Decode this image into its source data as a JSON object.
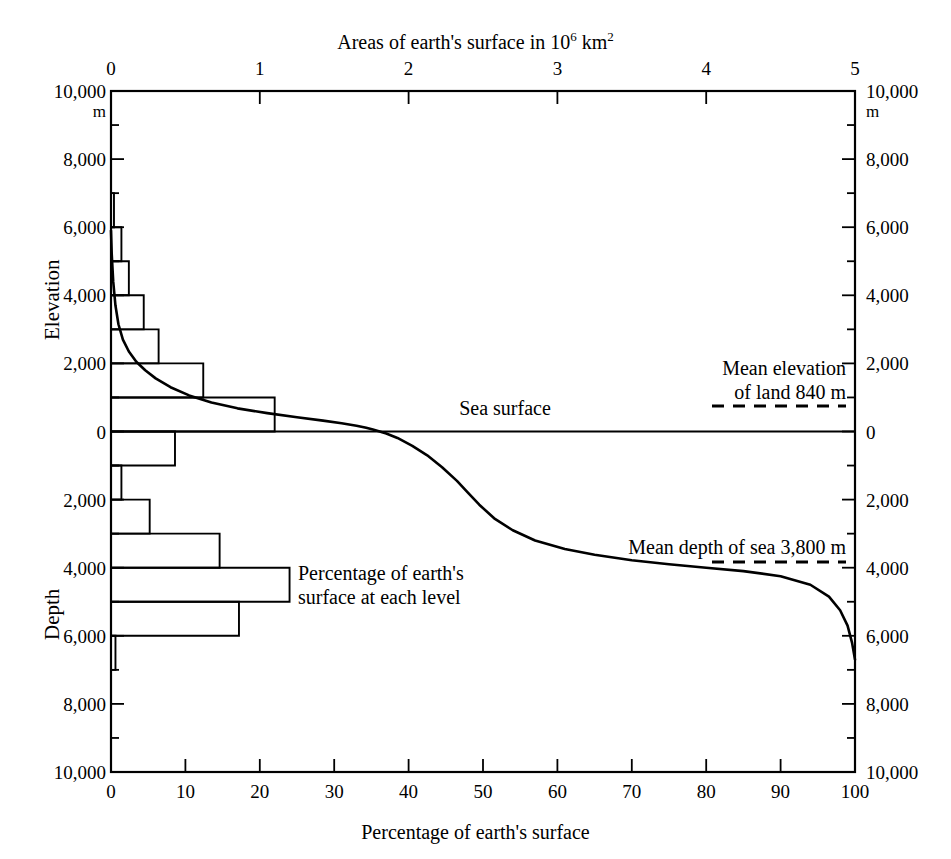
{
  "chart_data": {
    "type": "line",
    "title_base": "Areas of earth's surface in 10",
    "title_sup": "6",
    "title_tail": " km",
    "title_tail_sup": "2",
    "xlabel": "Percentage of earth's surface",
    "ylabel_upper": "Elevation",
    "ylabel_lower": "Depth",
    "unit_label": "m",
    "xlim": [
      0,
      100
    ],
    "ylim": [
      -10000,
      10000
    ],
    "grid": false,
    "legend": "none",
    "axes": {
      "bottom": {
        "name": "Percentage of earth's surface",
        "ticks": [
          "0",
          "10",
          "20",
          "30",
          "40",
          "50",
          "60",
          "70",
          "80",
          "90",
          "100"
        ],
        "values": [
          0,
          10,
          20,
          30,
          40,
          50,
          60,
          70,
          80,
          90,
          100
        ]
      },
      "top": {
        "name": "Areas of earth's surface in 10^6 km^2",
        "ticks": [
          "0",
          "1",
          "2",
          "3",
          "4",
          "5"
        ],
        "values": [
          0,
          1,
          2,
          3,
          4,
          5
        ]
      },
      "left": {
        "upper_name": "Elevation",
        "lower_name": "Depth",
        "ticks": [
          "10,000",
          "8,000",
          "6,000",
          "4,000",
          "2,000",
          "0",
          "2,000",
          "4,000",
          "6,000",
          "8,000",
          "10,000"
        ],
        "values": [
          10000,
          8000,
          6000,
          4000,
          2000,
          0,
          -2000,
          -4000,
          -6000,
          -8000,
          -10000
        ]
      },
      "right": {
        "ticks": [
          "10,000",
          "8,000",
          "6,000",
          "4,000",
          "2,000",
          "0",
          "2,000",
          "4,000",
          "6,000",
          "8,000",
          "10,000"
        ],
        "values": [
          10000,
          8000,
          6000,
          4000,
          2000,
          0,
          -2000,
          -4000,
          -6000,
          -8000,
          -10000
        ]
      }
    },
    "series": [
      {
        "name": "Hypsographic curve",
        "style": "solid-line",
        "x": [
          0.0,
          0.1,
          0.3,
          0.6,
          1.0,
          1.6,
          2.4,
          3.4,
          4.6,
          6.0,
          8.0,
          10.5,
          13.5,
          17.0,
          21.0,
          25.0,
          28.5,
          31.0,
          33.0,
          34.3,
          35.2,
          36.0,
          37.0,
          38.5,
          40.5,
          42.5,
          44.5,
          46.5,
          48.0,
          49.5,
          51.5,
          54.0,
          57.0,
          61.0,
          65.0,
          70.0,
          75.0,
          80.0,
          85.0,
          90.0,
          94.0,
          96.5,
          98.0,
          99.0,
          99.6,
          100.0
        ],
        "y": [
          5900,
          5200,
          4400,
          3700,
          3150,
          2700,
          2350,
          2050,
          1800,
          1560,
          1300,
          1060,
          850,
          680,
          540,
          420,
          320,
          240,
          170,
          110,
          60,
          10,
          -60,
          -190,
          -420,
          -700,
          -1050,
          -1450,
          -1800,
          -2150,
          -2550,
          -2900,
          -3200,
          -3450,
          -3620,
          -3780,
          -3900,
          -4000,
          -4100,
          -4250,
          -4500,
          -4850,
          -5250,
          -5700,
          -6200,
          -6700
        ]
      }
    ],
    "histogram": {
      "name": "Percentage of earth's surface at each level",
      "units": "10^6 km^2 per 1000 m interval",
      "bins": [
        {
          "top": 7000,
          "bottom": 6000,
          "value": 0.02
        },
        {
          "top": 6000,
          "bottom": 5000,
          "value": 0.07
        },
        {
          "top": 5000,
          "bottom": 4000,
          "value": 0.12
        },
        {
          "top": 4000,
          "bottom": 3000,
          "value": 0.22
        },
        {
          "top": 3000,
          "bottom": 2000,
          "value": 0.32
        },
        {
          "top": 2000,
          "bottom": 1000,
          "value": 0.62
        },
        {
          "top": 1000,
          "bottom": 0,
          "value": 1.1
        },
        {
          "top": 0,
          "bottom": -1000,
          "value": 0.43
        },
        {
          "top": -1000,
          "bottom": -2000,
          "value": 0.07
        },
        {
          "top": -2000,
          "bottom": -3000,
          "value": 0.26
        },
        {
          "top": -3000,
          "bottom": -4000,
          "value": 0.73
        },
        {
          "top": -4000,
          "bottom": -5000,
          "value": 1.2
        },
        {
          "top": -5000,
          "bottom": -6000,
          "value": 0.86
        },
        {
          "top": -6000,
          "bottom": -7000,
          "value": 0.03
        }
      ]
    },
    "annotations": [
      {
        "id": "sea-surface",
        "text": "Sea surface",
        "x_pct": 55,
        "y_m": 900
      },
      {
        "id": "mean-elevation",
        "line1": "Mean elevation",
        "line2": "of land 840 m",
        "value_m": 840,
        "marker": "dashed",
        "x_pct": 92,
        "y_m": 2000
      },
      {
        "id": "mean-depth",
        "text": "Mean depth of sea 3,800 m",
        "value_m": -3800,
        "marker": "dashed",
        "x_pct": 92,
        "y_m": -3450
      },
      {
        "id": "histogram-label",
        "line1": "Percentage of earth's",
        "line2": "surface at each level",
        "x_pct": 26,
        "y_m": -4400
      }
    ]
  },
  "texts": {
    "top_title_base": "Areas of earth's surface in 10",
    "top_title_sup1": "6",
    "top_title_mid": " km",
    "top_title_sup2": "2",
    "bottom_title": "Percentage of earth's surface",
    "elevation_label": "Elevation",
    "depth_label": "Depth",
    "unit_m": "m",
    "sea_surface": "Sea surface",
    "mean_elev_l1": "Mean elevation",
    "mean_elev_l2": "of land 840 m",
    "mean_depth": "Mean depth of sea 3,800 m",
    "hist_l1": "Percentage of earth's",
    "hist_l2": "surface at each level"
  },
  "ticks": {
    "top": [
      "0",
      "1",
      "2",
      "3",
      "4",
      "5"
    ],
    "bottom": [
      "0",
      "10",
      "20",
      "30",
      "40",
      "50",
      "60",
      "70",
      "80",
      "90",
      "100"
    ],
    "left": [
      "10,000",
      "8,000",
      "6,000",
      "4,000",
      "2,000",
      "0",
      "2,000",
      "4,000",
      "6,000",
      "8,000",
      "10,000"
    ],
    "right": [
      "10,000",
      "8,000",
      "6,000",
      "4,000",
      "2,000",
      "0",
      "2,000",
      "4,000",
      "6,000",
      "8,000",
      "10,000"
    ]
  },
  "colors": {
    "ink": "#000000",
    "background": "#ffffff"
  }
}
